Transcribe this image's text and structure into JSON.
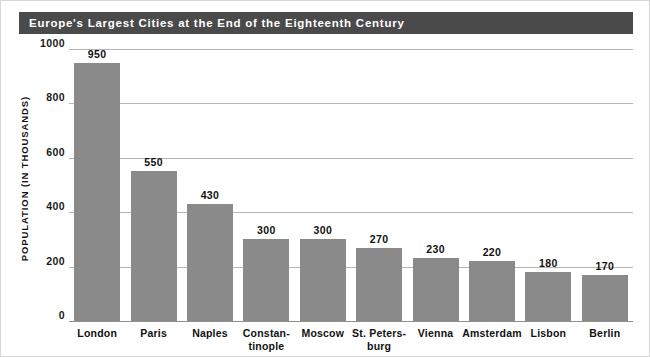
{
  "chart_data": {
    "type": "bar",
    "title": "Europe's Largest Cities at the End of the Eighteenth Century",
    "xlabel": "",
    "ylabel": "POPULATION (IN THOUSANDS)",
    "categories": [
      "London",
      "Paris",
      "Naples",
      "Constantinople",
      "Moscow",
      "St. Petersburg",
      "Vienna",
      "Amsterdam",
      "Lisbon",
      "Berlin"
    ],
    "category_lines": [
      [
        "London"
      ],
      [
        "Paris"
      ],
      [
        "Naples"
      ],
      [
        "Constan-",
        "tinople"
      ],
      [
        "Moscow"
      ],
      [
        "St. Peters-",
        "burg"
      ],
      [
        "Vienna"
      ],
      [
        "Amsterdam"
      ],
      [
        "Lisbon"
      ],
      [
        "Berlin"
      ]
    ],
    "values": [
      950,
      550,
      430,
      300,
      300,
      270,
      230,
      220,
      180,
      170
    ],
    "value_labels": [
      "950",
      "550",
      "430",
      "300",
      "300",
      "270",
      "230",
      "220",
      "180",
      "170"
    ],
    "ylim": [
      0,
      1000
    ],
    "yticks": [
      0,
      200,
      400,
      600,
      800,
      1000
    ],
    "ytick_labels": [
      "0",
      "200",
      "400",
      "600",
      "800",
      "1000"
    ],
    "grid": true,
    "legend": false,
    "bar_color": "#8a8a8a",
    "title_band_color": "#4a4a4a",
    "title_text_color": "#ffffff",
    "gridline_color": "#b5b5b5",
    "background_color": "#ffffff"
  }
}
